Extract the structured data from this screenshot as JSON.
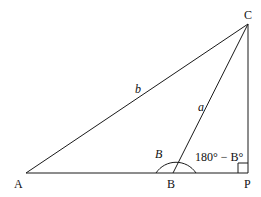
{
  "diagram": {
    "colors": {
      "stroke": "#1a1a1a",
      "background": "#ffffff"
    },
    "points": {
      "A": {
        "label": "A",
        "x": 26,
        "y": 173
      },
      "B": {
        "label": "B",
        "x": 173,
        "y": 173
      },
      "C": {
        "label": "C",
        "x": 248,
        "y": 24
      },
      "P": {
        "label": "P",
        "x": 248,
        "y": 173
      }
    },
    "sides": {
      "b": {
        "label": "b",
        "from": "A",
        "to": "C"
      },
      "a": {
        "label": "a",
        "from": "B",
        "to": "C"
      }
    },
    "angles": {
      "B": {
        "label": "B",
        "at": "B"
      },
      "exterior": {
        "label": "180° − B°",
        "at": "B"
      },
      "right": {
        "at": "P",
        "type": "right-angle"
      }
    }
  }
}
